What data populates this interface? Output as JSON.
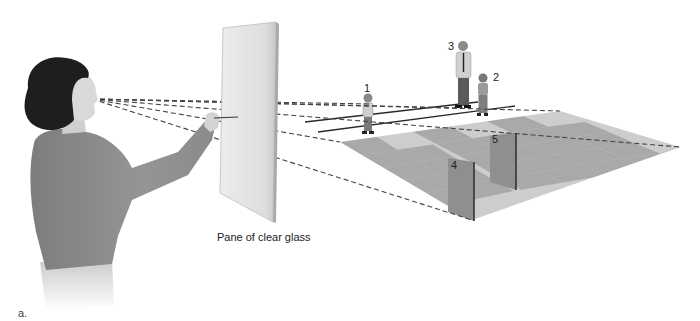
{
  "figure": {
    "panel_letter": "a.",
    "glass_label": "Pane of clear glass",
    "objects": [
      {
        "id": "1",
        "label": "1",
        "kind": "small-child-figure"
      },
      {
        "id": "2",
        "label": "2",
        "kind": "girl-figure"
      },
      {
        "id": "3",
        "label": "3",
        "kind": "adult-man-figure"
      },
      {
        "id": "4",
        "label": "4",
        "kind": "near-panel"
      },
      {
        "id": "5",
        "label": "5",
        "kind": "far-panel"
      }
    ],
    "elements": {
      "observer": "woman-tracing-on-glass",
      "glass": "pane-of-clear-glass",
      "floor": "checkerboard-ground-plane",
      "sight_lines": "dashed-lines-from-eye"
    }
  },
  "colors": {
    "background": "#ffffff",
    "floor_light": "#c9c9c9",
    "floor_dark": "#a6a6a6",
    "glass": "#e4e4e4",
    "sweater": "#8e8e8e",
    "hair": "#1e1e1e",
    "skin": "#d8d8d8",
    "dash": "#444444"
  }
}
